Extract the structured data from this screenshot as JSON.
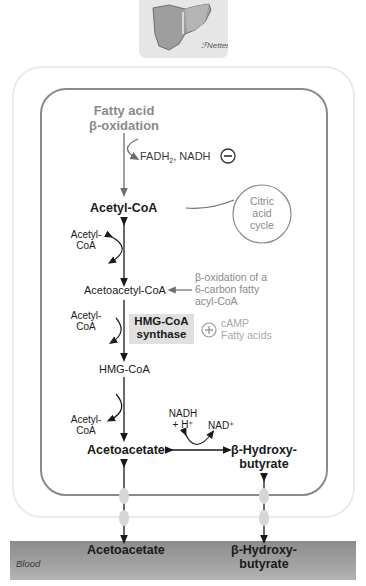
{
  "header": {
    "organ_icon": "liver-icon",
    "signature": "F. Netter"
  },
  "pathway": {
    "source_label_line1": "Fatty acid",
    "source_label_line2": "β-oxidation",
    "byproducts": "FADH",
    "byproducts_sub": "2",
    "byproducts_rest": ", NADH",
    "inhibition_symbol": "−",
    "acetyl_coa": "Acetyl-CoA",
    "citric_acid_cycle": [
      "Citric",
      "acid",
      "cycle"
    ],
    "acetyl_coa_side_1": [
      "Acetyl-",
      "CoA"
    ],
    "acetoacetyl_coa": "Acetoacetyl-CoA",
    "beta_ox_note": [
      "β-oxidation of a",
      "6-carbon fatty",
      "acyl-CoA"
    ],
    "acetyl_coa_side_2": [
      "Acetyl-",
      "CoA"
    ],
    "enzyme": [
      "HMG-CoA",
      "synthase"
    ],
    "activation_symbol": "+",
    "activators": [
      "cAMP",
      "Fatty acids"
    ],
    "hmg_coa": "HMG-CoA",
    "acetyl_coa_side_3": [
      "Acetyl-",
      "CoA"
    ],
    "nadh": [
      "NADH",
      "+ H⁺"
    ],
    "nad": "NAD⁺",
    "acetoacetate": "Acetoacetate",
    "beta_hydroxybutyrate": [
      "β-Hydroxy-",
      "butyrate"
    ]
  },
  "blood": {
    "label": "Blood",
    "acetoacetate": "Acetoacetate",
    "beta_hydroxybutyrate": [
      "β-Hydroxy-",
      "butyrate"
    ]
  },
  "colors": {
    "inner_membrane": "#8a8a8a",
    "outer_membrane": "#ebebeb",
    "blood": "#a0a0a0",
    "regulator_text": "#8a8a8a",
    "enzyme_box": "#e0e0e0"
  }
}
